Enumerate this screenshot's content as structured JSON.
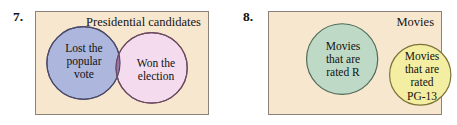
{
  "diagram_set": {
    "type": "venn-diagram-pair",
    "background": "#ffffff",
    "box_fill": "#f8e7cf",
    "box_stroke": "#8b8377",
    "problems": [
      {
        "number": "7.",
        "universe_label": "Presidential candidates",
        "relationship": "overlapping",
        "circles": [
          {
            "name": "lost-popular-vote",
            "label": "Lost the\npopular\nvote",
            "fill": "#adb6dd",
            "stroke": "#4a4a6a"
          },
          {
            "name": "won-election",
            "label": "Won the\nelection",
            "fill": "#f4dcee",
            "stroke": "#6d4a60"
          }
        ],
        "intersection": {
          "name": "lost-popular-vote-and-won-election",
          "fill": "#9b73ab",
          "label": ""
        }
      },
      {
        "number": "8.",
        "universe_label": "Movies",
        "relationship": "disjoint",
        "circles": [
          {
            "name": "movies-rated-r",
            "label": "Movies\nthat are\nrated R",
            "fill": "#bedac7",
            "stroke": "#4f6b57"
          },
          {
            "name": "movies-rated-pg13",
            "label": "Movies\nthat are\nrated\nPG-13",
            "fill": "#f3eea1",
            "stroke": "#7a7437"
          }
        ],
        "intersection": null
      }
    ]
  }
}
